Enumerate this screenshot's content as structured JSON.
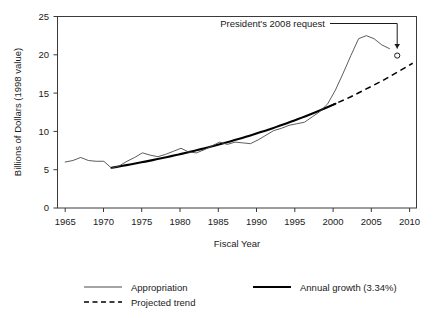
{
  "chart_data": {
    "type": "line",
    "title": "",
    "xlabel": "Fiscal Year",
    "ylabel": "Billions of Dollars (1998 value)",
    "xlim": [
      1964,
      2010.5
    ],
    "ylim": [
      0,
      25
    ],
    "xticks": [
      "1965",
      "1970",
      "1975",
      "1980",
      "1985",
      "1990",
      "1995",
      "2000",
      "2005",
      "2010"
    ],
    "xtick_values": [
      1965,
      1970,
      1975,
      1980,
      1985,
      1990,
      1995,
      2000,
      2005,
      2010
    ],
    "yticks": [
      "0",
      "5",
      "10",
      "15",
      "20",
      "25"
    ],
    "ytick_values": [
      0,
      5,
      10,
      15,
      20,
      25
    ],
    "grid": false,
    "legend_position": "below",
    "series": [
      {
        "name": "Appropriation",
        "style": "thin-solid",
        "color": "#4a4a4a",
        "x": [
          1965,
          1966,
          1967,
          1968,
          1969,
          1970,
          1971,
          1972,
          1973,
          1974,
          1975,
          1976,
          1977,
          1978,
          1979,
          1980,
          1981,
          1982,
          1983,
          1984,
          1985,
          1986,
          1987,
          1988,
          1989,
          1990,
          1991,
          1992,
          1993,
          1994,
          1995,
          1996,
          1997,
          1998,
          1999,
          2000,
          2001,
          2002,
          2003,
          2004,
          2005,
          2006,
          2007
        ],
        "values": [
          6.0,
          6.2,
          6.6,
          6.2,
          6.1,
          6.1,
          5.2,
          5.5,
          6.1,
          6.6,
          7.2,
          6.9,
          6.7,
          7.0,
          7.4,
          7.8,
          7.3,
          7.2,
          7.6,
          8.1,
          8.6,
          8.3,
          8.6,
          8.5,
          8.4,
          8.9,
          9.5,
          10.1,
          10.4,
          10.8,
          11.0,
          11.2,
          11.9,
          12.6,
          13.6,
          15.4,
          17.6,
          19.9,
          22.1,
          22.5,
          22.1,
          21.3,
          20.8
        ]
      },
      {
        "name": "Annual growth (3.34%)",
        "style": "thick-solid",
        "color": "#000000",
        "x": [
          1971,
          1975,
          1980,
          1985,
          1990,
          1995,
          1998,
          2000
        ],
        "values": [
          5.25,
          5.99,
          7.05,
          8.31,
          9.79,
          11.53,
          12.73,
          13.59
        ]
      },
      {
        "name": "Projected trend",
        "style": "dashed",
        "color": "#000000",
        "x": [
          1998,
          2002,
          2006,
          2010
        ],
        "values": [
          12.73,
          14.52,
          16.57,
          18.9
        ]
      }
    ],
    "annotations": [
      {
        "text": "President's 2008 request",
        "point_x": 2008,
        "point_y": 19.9,
        "marker": "open-circle"
      }
    ]
  },
  "legend": {
    "items": [
      {
        "label": "Appropriation",
        "style": "thin-solid"
      },
      {
        "label": "Projected trend",
        "style": "dashed"
      },
      {
        "label": "Annual growth (3.34%)",
        "style": "thick-solid"
      }
    ]
  }
}
